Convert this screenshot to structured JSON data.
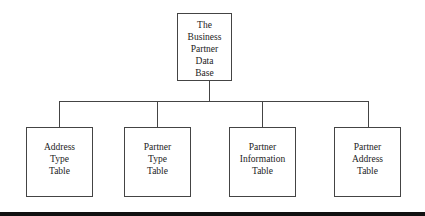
{
  "diagram": {
    "type": "hierarchy",
    "root": {
      "label": "The\nBusiness\nPartner\nData\nBase"
    },
    "children": [
      {
        "label": "Address\nType\nTable"
      },
      {
        "label": "Partner\nType\nTable"
      },
      {
        "label": "Partner\nInformation\nTable"
      },
      {
        "label": "Partner\nAddress\nTable"
      }
    ]
  },
  "colors": {
    "line": "#444444",
    "bottom_bar": "#111111",
    "background": "#ffffff"
  }
}
